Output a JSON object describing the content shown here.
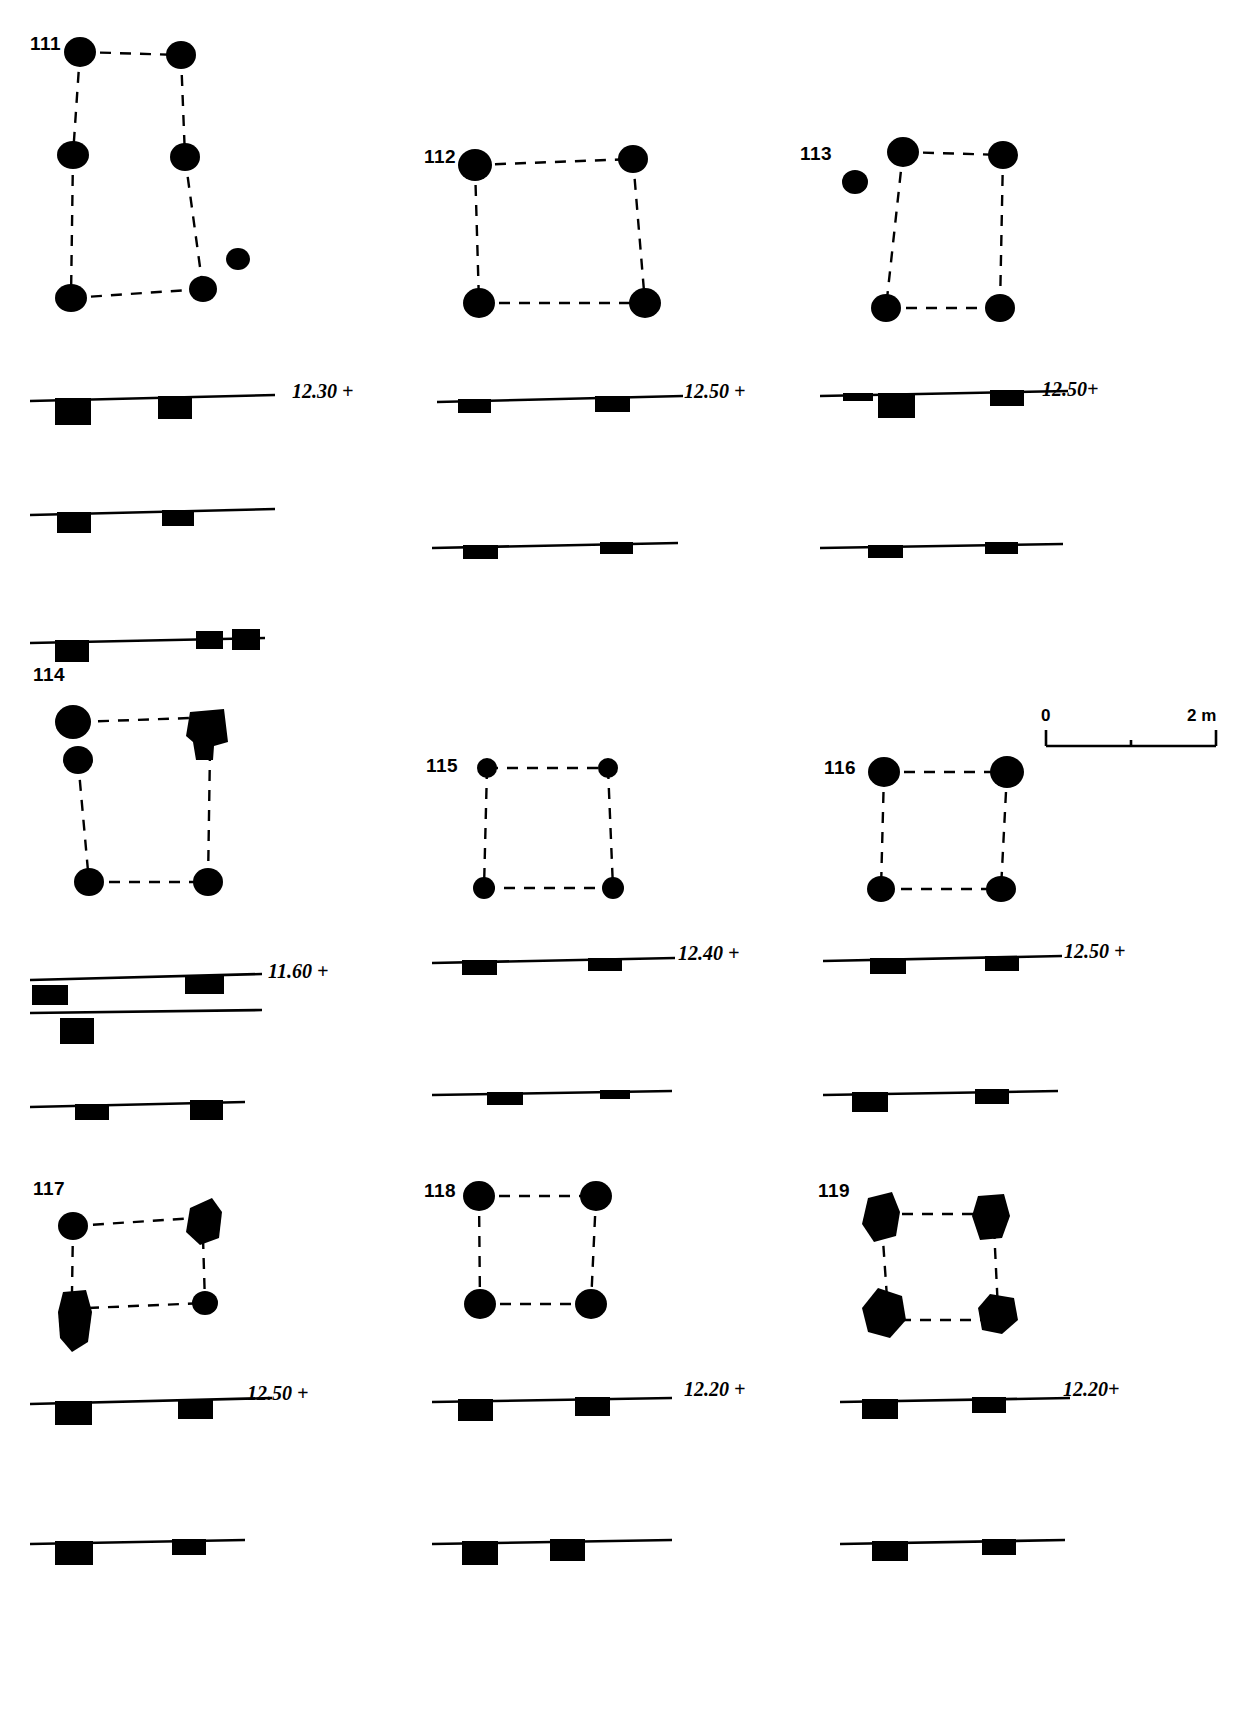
{
  "figure": {
    "title": "",
    "structures": [
      {
        "id": "111",
        "label": "111",
        "plan": {
          "postholes": [
            {
              "cx": 80,
              "cy": 52,
              "rx": 16,
              "ry": 15
            },
            {
              "cx": 181,
              "cy": 55,
              "rx": 15,
              "ry": 14
            },
            {
              "cx": 73,
              "cy": 155,
              "rx": 16,
              "ry": 14
            },
            {
              "cx": 185,
              "cy": 157,
              "rx": 15,
              "ry": 14
            },
            {
              "cx": 71,
              "cy": 298,
              "rx": 16,
              "ry": 14
            },
            {
              "cx": 203,
              "cy": 289,
              "rx": 14,
              "ry": 13
            },
            {
              "cx": 238,
              "cy": 259,
              "rx": 12,
              "ry": 11
            }
          ],
          "links": [
            [
              0,
              1
            ],
            [
              0,
              2
            ],
            [
              2,
              4
            ],
            [
              1,
              3
            ],
            [
              3,
              5
            ],
            [
              4,
              5
            ]
          ]
        },
        "elevation": "12.30 +",
        "sections": [
          {
            "y": 398,
            "x0": 30,
            "x1": 275,
            "tilt": -3,
            "cuts": [
              {
                "x": 55,
                "w": 36,
                "h": 27
              },
              {
                "x": 158,
                "w": 34,
                "h": 23
              }
            ]
          },
          {
            "y": 512,
            "x0": 30,
            "x1": 275,
            "tilt": -3,
            "cuts": [
              {
                "x": 57,
                "w": 34,
                "h": 21
              },
              {
                "x": 162,
                "w": 32,
                "h": 16
              }
            ]
          },
          {
            "y": 640,
            "x0": 30,
            "x1": 265,
            "tilt": -2,
            "cuts": [
              {
                "x": 55,
                "w": 34,
                "h": 22
              },
              {
                "x": 196,
                "w": 27,
                "h": 18
              },
              {
                "x": 232,
                "w": 28,
                "h": 21
              }
            ]
          }
        ]
      },
      {
        "id": "112",
        "label": "112",
        "plan": {
          "postholes": [
            {
              "cx": 475,
              "cy": 165,
              "rx": 17,
              "ry": 16
            },
            {
              "cx": 633,
              "cy": 159,
              "rx": 15,
              "ry": 14
            },
            {
              "cx": 479,
              "cy": 303,
              "rx": 16,
              "ry": 15
            },
            {
              "cx": 645,
              "cy": 303,
              "rx": 16,
              "ry": 15
            }
          ],
          "links": [
            [
              0,
              1
            ],
            [
              0,
              2
            ],
            [
              1,
              3
            ],
            [
              2,
              3
            ]
          ]
        },
        "elevation": "12.50 +",
        "sections": [
          {
            "y": 398,
            "x0": 437,
            "x1": 683,
            "tilt": -3,
            "cuts": [
              {
                "x": 458,
                "w": 33,
                "h": 14
              },
              {
                "x": 595,
                "w": 35,
                "h": 16
              }
            ]
          },
          {
            "y": 545,
            "x0": 432,
            "x1": 678,
            "tilt": -2,
            "cuts": [
              {
                "x": 463,
                "w": 35,
                "h": 14
              },
              {
                "x": 600,
                "w": 33,
                "h": 12
              }
            ]
          }
        ]
      },
      {
        "id": "113",
        "label": "113",
        "plan": {
          "postholes": [
            {
              "cx": 855,
              "cy": 182,
              "rx": 13,
              "ry": 12
            },
            {
              "cx": 903,
              "cy": 152,
              "rx": 16,
              "ry": 15
            },
            {
              "cx": 1003,
              "cy": 155,
              "rx": 15,
              "ry": 14
            },
            {
              "cx": 886,
              "cy": 308,
              "rx": 15,
              "ry": 14
            },
            {
              "cx": 1000,
              "cy": 308,
              "rx": 15,
              "ry": 14
            }
          ],
          "links": [
            [
              1,
              2
            ],
            [
              1,
              3
            ],
            [
              2,
              4
            ],
            [
              3,
              4
            ]
          ]
        },
        "elevation": "12.50+",
        "sections": [
          {
            "y": 392,
            "x0": 820,
            "x1": 1068,
            "tilt": -2,
            "cuts": [
              {
                "x": 843,
                "w": 30,
                "h": 8
              },
              {
                "x": 878,
                "w": 37,
                "h": 25
              },
              {
                "x": 990,
                "w": 34,
                "h": 16
              }
            ]
          },
          {
            "y": 545,
            "x0": 820,
            "x1": 1063,
            "tilt": -2,
            "cuts": [
              {
                "x": 868,
                "w": 35,
                "h": 13
              },
              {
                "x": 985,
                "w": 33,
                "h": 12
              }
            ]
          }
        ]
      },
      {
        "id": "114",
        "label": "114",
        "plan": {
          "postholes": [
            {
              "cx": 73,
              "cy": 722,
              "rx": 18,
              "ry": 17
            },
            {
              "cx": 78,
              "cy": 760,
              "rx": 15,
              "ry": 14
            },
            {
              "cx": 89,
              "cy": 882,
              "rx": 15,
              "ry": 14
            },
            {
              "cx": 208,
              "cy": 882,
              "rx": 15,
              "ry": 14
            }
          ],
          "links": [
            [
              0,
              2
            ],
            [
              1,
              2
            ],
            [
              2,
              3
            ]
          ],
          "irregular": [
            {
              "points": "190,712 224,709 228,742 214,746 213,760 196,760 193,742 186,736",
              "note": "irregular-posthole"
            }
          ]
        },
        "elevation": "11.60 +",
        "sections": [
          {
            "y": 978,
            "x0": 30,
            "x1": 262,
            "tilt": -4,
            "cuts": [
              {
                "x": 32,
                "w": 36,
                "h": 20,
                "detached": true
              },
              {
                "x": 185,
                "w": 39,
                "h": 18
              }
            ]
          },
          {
            "y": 1008,
            "x0": 30,
            "x1": 262,
            "tilt": -2,
            "cuts": [
              {
                "x": 60,
                "w": 34,
                "h": 26,
                "detached": true
              }
            ]
          },
          {
            "y": 1105,
            "x0": 30,
            "x1": 245,
            "tilt": -3,
            "cuts": [
              {
                "x": 75,
                "w": 34,
                "h": 16
              },
              {
                "x": 190,
                "w": 33,
                "h": 20
              }
            ]
          }
        ]
      },
      {
        "id": "115",
        "label": "115",
        "plan": {
          "postholes": [
            {
              "cx": 487,
              "cy": 768,
              "rx": 10,
              "ry": 10
            },
            {
              "cx": 608,
              "cy": 768,
              "rx": 10,
              "ry": 10
            },
            {
              "cx": 484,
              "cy": 888,
              "rx": 11,
              "ry": 11
            },
            {
              "cx": 613,
              "cy": 888,
              "rx": 11,
              "ry": 11
            }
          ],
          "links": [
            [
              0,
              1
            ],
            [
              0,
              2
            ],
            [
              1,
              3
            ],
            [
              2,
              3
            ]
          ]
        },
        "elevation": "12.40 +",
        "sections": [
          {
            "y": 960,
            "x0": 432,
            "x1": 675,
            "tilt": -2,
            "cuts": [
              {
                "x": 462,
                "w": 35,
                "h": 15
              },
              {
                "x": 588,
                "w": 34,
                "h": 13
              }
            ]
          },
          {
            "y": 1092,
            "x0": 432,
            "x1": 672,
            "tilt": -2,
            "cuts": [
              {
                "x": 487,
                "w": 36,
                "h": 13
              },
              {
                "x": 600,
                "w": 30,
                "h": 9
              }
            ]
          }
        ]
      },
      {
        "id": "116",
        "label": "116",
        "plan": {
          "postholes": [
            {
              "cx": 884,
              "cy": 772,
              "rx": 16,
              "ry": 15
            },
            {
              "cx": 1007,
              "cy": 772,
              "rx": 17,
              "ry": 16
            },
            {
              "cx": 881,
              "cy": 889,
              "rx": 14,
              "ry": 13
            },
            {
              "cx": 1001,
              "cy": 889,
              "rx": 15,
              "ry": 13
            }
          ],
          "links": [
            [
              0,
              1
            ],
            [
              0,
              2
            ],
            [
              1,
              3
            ],
            [
              2,
              3
            ]
          ]
        },
        "elevation": "12.50 +",
        "sections": [
          {
            "y": 958,
            "x0": 823,
            "x1": 1062,
            "tilt": -2,
            "cuts": [
              {
                "x": 870,
                "w": 36,
                "h": 16
              },
              {
                "x": 985,
                "w": 34,
                "h": 15
              }
            ]
          },
          {
            "y": 1092,
            "x0": 823,
            "x1": 1058,
            "tilt": -2,
            "cuts": [
              {
                "x": 852,
                "w": 36,
                "h": 20
              },
              {
                "x": 975,
                "w": 34,
                "h": 15
              }
            ]
          }
        ]
      },
      {
        "id": "117",
        "label": "117",
        "plan": {
          "postholes": [
            {
              "cx": 73,
              "cy": 1226,
              "rx": 15,
              "ry": 14
            },
            {
              "cx": 205,
              "cy": 1303,
              "rx": 13,
              "ry": 12
            }
          ],
          "links": [
            [
              0,
              1
            ]
          ],
          "irregular": [
            {
              "points": "190,1208 212,1198 222,1212 219,1238 200,1245 186,1232",
              "note": "irregular-posthole"
            },
            {
              "points": "63,1292 86,1290 92,1312 88,1342 72,1352 60,1338 58,1312",
              "note": "irregular-posthole"
            }
          ]
        },
        "elevation": "12.50 +",
        "sections": [
          {
            "y": 1400,
            "x0": 30,
            "x1": 272,
            "tilt": -3,
            "cuts": [
              {
                "x": 55,
                "w": 37,
                "h": 24
              },
              {
                "x": 178,
                "w": 35,
                "h": 20
              }
            ]
          },
          {
            "y": 1540,
            "x0": 30,
            "x1": 245,
            "tilt": -2,
            "cuts": [
              {
                "x": 55,
                "w": 38,
                "h": 24
              },
              {
                "x": 172,
                "w": 34,
                "h": 16
              }
            ]
          }
        ]
      },
      {
        "id": "118",
        "label": "118",
        "plan": {
          "postholes": [
            {
              "cx": 479,
              "cy": 1196,
              "rx": 16,
              "ry": 15
            },
            {
              "cx": 596,
              "cy": 1196,
              "rx": 16,
              "ry": 15
            },
            {
              "cx": 480,
              "cy": 1304,
              "rx": 16,
              "ry": 15
            },
            {
              "cx": 591,
              "cy": 1304,
              "rx": 16,
              "ry": 15
            }
          ],
          "links": [
            [
              0,
              1
            ],
            [
              0,
              2
            ],
            [
              1,
              3
            ],
            [
              2,
              3
            ]
          ]
        },
        "elevation": "12.20 +",
        "sections": [
          {
            "y": 1398,
            "x0": 432,
            "x1": 672,
            "tilt": -2,
            "cuts": [
              {
                "x": 458,
                "w": 35,
                "h": 22
              },
              {
                "x": 575,
                "w": 35,
                "h": 19
              }
            ]
          },
          {
            "y": 1540,
            "x0": 432,
            "x1": 672,
            "tilt": -2,
            "cuts": [
              {
                "x": 462,
                "w": 36,
                "h": 24
              },
              {
                "x": 550,
                "w": 35,
                "h": 22
              }
            ]
          }
        ]
      },
      {
        "id": "119",
        "label": "119",
        "plan": {
          "postholes": [],
          "links": [
            [
              0,
              1
            ],
            [
              0,
              2
            ],
            [
              1,
              3
            ],
            [
              2,
              3
            ]
          ],
          "irregular": [
            {
              "points": "868,1198 892,1192 900,1212 896,1236 874,1242 862,1224",
              "note": "irregular-posthole"
            },
            {
              "points": "978,1196 1004,1194 1010,1216 1002,1238 980,1240 972,1216",
              "note": "irregular-posthole"
            },
            {
              "points": "878,1288 902,1296 906,1320 890,1338 868,1332 862,1308",
              "note": "irregular-posthole"
            },
            {
              "points": "990,1294 1014,1298 1018,1320 1002,1334 982,1330 978,1308",
              "note": "irregular-posthole"
            }
          ]
        },
        "elevation": "12.20+",
        "sections": [
          {
            "y": 1398,
            "x0": 840,
            "x1": 1070,
            "tilt": -2,
            "cuts": [
              {
                "x": 862,
                "w": 36,
                "h": 20
              },
              {
                "x": 972,
                "w": 34,
                "h": 16
              }
            ]
          },
          {
            "y": 1540,
            "x0": 840,
            "x1": 1065,
            "tilt": -2,
            "cuts": [
              {
                "x": 872,
                "w": 36,
                "h": 20
              },
              {
                "x": 982,
                "w": 34,
                "h": 16
              }
            ]
          }
        ]
      }
    ],
    "scale": {
      "start_label": "0",
      "end_label": "2 m",
      "x": 1045,
      "y": 730,
      "length": 170
    }
  }
}
